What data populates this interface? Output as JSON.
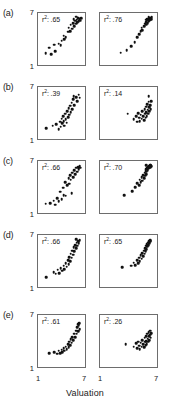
{
  "figure": {
    "xlabel": "Valuation",
    "x_ticks": [
      "1",
      "7"
    ],
    "y_ticks": [
      "7",
      "1"
    ],
    "rows": [
      {
        "label": "(a)",
        "panels": [
          {
            "r2_prefix": "r",
            "r2_sup": "2",
            "r2_value": ": .65"
          },
          {
            "r2_prefix": "r",
            "r2_sup": "2",
            "r2_value": ": .76"
          }
        ]
      },
      {
        "label": "(b)",
        "panels": [
          {
            "r2_prefix": "r",
            "r2_sup": "2",
            "r2_value": ": .39"
          },
          {
            "r2_prefix": "r",
            "r2_sup": "2",
            "r2_value": ": .14"
          }
        ]
      },
      {
        "label": "(c)",
        "panels": [
          {
            "r2_prefix": "r",
            "r2_sup": "2",
            "r2_value": ": .66"
          },
          {
            "r2_prefix": "r",
            "r2_sup": "2",
            "r2_value": ": .70"
          }
        ]
      },
      {
        "label": "(d)",
        "panels": [
          {
            "r2_prefix": "r",
            "r2_sup": "2",
            "r2_value": ": .66"
          },
          {
            "r2_prefix": "r",
            "r2_sup": "2",
            "r2_value": ": .65"
          }
        ]
      },
      {
        "label": "(e)",
        "panels": [
          {
            "r2_prefix": "r",
            "r2_sup": "2",
            "r2_value": ": .61"
          },
          {
            "r2_prefix": "r",
            "r2_sup": "2",
            "r2_value": ": .26"
          }
        ]
      }
    ]
  },
  "chart_data": {
    "type": "scatter",
    "title": "",
    "xlabel": "Valuation",
    "ylabel": "",
    "xlim": [
      1,
      7
    ],
    "ylim": [
      1,
      7
    ],
    "xticks": [
      1,
      7
    ],
    "yticks": [
      1,
      7
    ],
    "grid": false,
    "legend": "none",
    "panel_layout": {
      "rows": 5,
      "cols": 2
    },
    "panels": [
      {
        "row": "(a)",
        "col": 1,
        "annotation": "r2: .65",
        "r_squared": 0.65,
        "points": [
          [
            1.8,
            2.2
          ],
          [
            2.6,
            2.1
          ],
          [
            3.1,
            2.5
          ],
          [
            2.3,
            2.9
          ],
          [
            3.0,
            3.3
          ],
          [
            3.6,
            3.4
          ],
          [
            4.0,
            3.8
          ],
          [
            4.3,
            4.4
          ],
          [
            4.6,
            4.2
          ],
          [
            4.9,
            4.9
          ],
          [
            5.0,
            5.4
          ],
          [
            5.2,
            5.0
          ],
          [
            5.3,
            5.8
          ],
          [
            5.5,
            5.3
          ],
          [
            5.6,
            6.0
          ],
          [
            5.8,
            5.6
          ],
          [
            5.9,
            6.3
          ],
          [
            6.0,
            5.9
          ],
          [
            6.1,
            6.4
          ],
          [
            6.2,
            6.1
          ],
          [
            6.3,
            6.6
          ],
          [
            6.4,
            6.2
          ],
          [
            6.5,
            6.5
          ],
          [
            6.6,
            6.3
          ],
          [
            6.7,
            6.6
          ],
          [
            6.0,
            6.8
          ],
          [
            5.7,
            6.5
          ],
          [
            4.4,
            4.0
          ],
          [
            3.9,
            3.2
          ]
        ]
      },
      {
        "row": "(a)",
        "col": 2,
        "annotation": "r2: .76",
        "r_squared": 0.76,
        "points": [
          [
            3.1,
            2.3
          ],
          [
            3.8,
            2.6
          ],
          [
            4.3,
            3.1
          ],
          [
            4.7,
            3.6
          ],
          [
            5.0,
            4.2
          ],
          [
            5.2,
            4.6
          ],
          [
            5.4,
            5.0
          ],
          [
            5.5,
            5.4
          ],
          [
            5.6,
            5.1
          ],
          [
            5.8,
            5.6
          ],
          [
            5.9,
            5.9
          ],
          [
            6.0,
            6.1
          ],
          [
            6.05,
            5.8
          ],
          [
            6.1,
            6.3
          ],
          [
            6.2,
            6.0
          ],
          [
            6.25,
            6.4
          ],
          [
            6.3,
            6.2
          ],
          [
            6.35,
            6.5
          ],
          [
            6.4,
            6.3
          ],
          [
            6.45,
            6.6
          ],
          [
            6.5,
            6.4
          ],
          [
            6.55,
            6.6
          ],
          [
            6.6,
            6.5
          ],
          [
            6.65,
            6.7
          ],
          [
            6.3,
            6.7
          ],
          [
            6.15,
            6.5
          ],
          [
            5.95,
            6.4
          ]
        ]
      },
      {
        "row": "(b)",
        "col": 1,
        "annotation": "r2: .39",
        "r_squared": 0.39,
        "points": [
          [
            1.9,
            2.1
          ],
          [
            2.8,
            2.4
          ],
          [
            3.3,
            2.6
          ],
          [
            3.6,
            2.0
          ],
          [
            3.8,
            2.9
          ],
          [
            3.9,
            2.3
          ],
          [
            4.0,
            3.3
          ],
          [
            4.1,
            2.7
          ],
          [
            4.2,
            3.6
          ],
          [
            4.3,
            3.0
          ],
          [
            4.4,
            2.4
          ],
          [
            4.5,
            3.9
          ],
          [
            4.6,
            3.2
          ],
          [
            4.7,
            2.8
          ],
          [
            4.8,
            4.2
          ],
          [
            4.9,
            3.5
          ],
          [
            5.0,
            4.6
          ],
          [
            5.1,
            3.8
          ],
          [
            5.2,
            4.9
          ],
          [
            5.3,
            4.1
          ],
          [
            5.4,
            5.3
          ],
          [
            5.5,
            4.5
          ],
          [
            5.6,
            5.7
          ],
          [
            5.8,
            5.0
          ],
          [
            6.0,
            6.0
          ],
          [
            6.2,
            5.5
          ],
          [
            6.4,
            6.3
          ],
          [
            6.5,
            5.9
          ],
          [
            5.7,
            6.1
          ]
        ]
      },
      {
        "row": "(b)",
        "col": 2,
        "annotation": "r2: .14",
        "r_squared": 0.14,
        "points": [
          [
            3.9,
            3.9
          ],
          [
            4.6,
            3.2
          ],
          [
            4.9,
            3.6
          ],
          [
            5.0,
            2.9
          ],
          [
            5.1,
            4.0
          ],
          [
            5.2,
            3.4
          ],
          [
            5.3,
            3.0
          ],
          [
            5.4,
            3.8
          ],
          [
            5.5,
            3.3
          ],
          [
            5.6,
            4.2
          ],
          [
            5.7,
            3.6
          ],
          [
            5.8,
            3.1
          ],
          [
            5.85,
            4.5
          ],
          [
            5.9,
            3.9
          ],
          [
            5.95,
            3.4
          ],
          [
            6.0,
            4.8
          ],
          [
            6.05,
            4.1
          ],
          [
            6.1,
            3.6
          ],
          [
            6.15,
            5.1
          ],
          [
            6.2,
            4.4
          ],
          [
            6.25,
            3.9
          ],
          [
            6.3,
            5.4
          ],
          [
            6.35,
            4.7
          ],
          [
            6.4,
            4.2
          ],
          [
            6.5,
            5.0
          ],
          [
            6.55,
            4.5
          ],
          [
            6.6,
            5.5
          ],
          [
            6.3,
            6.1
          ]
        ]
      },
      {
        "row": "(c)",
        "col": 1,
        "annotation": "r2: .66",
        "r_squared": 0.66,
        "points": [
          [
            1.8,
            1.9
          ],
          [
            2.4,
            2.0
          ],
          [
            2.9,
            2.3
          ],
          [
            3.1,
            1.8
          ],
          [
            3.4,
            2.6
          ],
          [
            3.6,
            2.2
          ],
          [
            3.8,
            3.4
          ],
          [
            4.0,
            2.5
          ],
          [
            4.2,
            3.9
          ],
          [
            4.3,
            3.0
          ],
          [
            4.5,
            4.6
          ],
          [
            4.6,
            2.9
          ],
          [
            4.8,
            4.2
          ],
          [
            5.0,
            5.1
          ],
          [
            5.1,
            4.4
          ],
          [
            5.2,
            5.5
          ],
          [
            5.3,
            4.9
          ],
          [
            5.4,
            3.2
          ],
          [
            5.5,
            5.8
          ],
          [
            5.6,
            5.2
          ],
          [
            5.8,
            6.1
          ],
          [
            5.9,
            5.6
          ],
          [
            6.0,
            6.4
          ],
          [
            6.2,
            5.9
          ],
          [
            6.3,
            6.5
          ],
          [
            6.4,
            6.2
          ],
          [
            6.5,
            6.6
          ],
          [
            6.6,
            6.4
          ]
        ]
      },
      {
        "row": "(c)",
        "col": 2,
        "annotation": "r2: .70",
        "r_squared": 0.7,
        "points": [
          [
            3.5,
            3.0
          ],
          [
            4.4,
            3.5
          ],
          [
            4.8,
            4.0
          ],
          [
            5.0,
            4.5
          ],
          [
            5.2,
            4.2
          ],
          [
            5.3,
            4.9
          ],
          [
            5.4,
            4.6
          ],
          [
            5.5,
            5.2
          ],
          [
            5.6,
            4.8
          ],
          [
            5.7,
            5.5
          ],
          [
            5.8,
            5.1
          ],
          [
            5.85,
            5.8
          ],
          [
            5.9,
            5.4
          ],
          [
            5.95,
            6.0
          ],
          [
            6.0,
            5.6
          ],
          [
            6.05,
            6.2
          ],
          [
            6.1,
            5.9
          ],
          [
            6.15,
            6.4
          ],
          [
            6.2,
            6.1
          ],
          [
            6.25,
            6.5
          ],
          [
            6.3,
            6.3
          ],
          [
            6.35,
            6.6
          ],
          [
            6.4,
            6.4
          ],
          [
            6.45,
            6.7
          ],
          [
            6.5,
            6.5
          ],
          [
            6.55,
            6.7
          ],
          [
            6.6,
            6.6
          ],
          [
            6.0,
            6.7
          ]
        ]
      },
      {
        "row": "(d)",
        "col": 1,
        "annotation": "r2: .66",
        "r_squared": 0.66,
        "points": [
          [
            1.9,
            2.0
          ],
          [
            2.9,
            2.6
          ],
          [
            3.2,
            2.4
          ],
          [
            3.5,
            2.9
          ],
          [
            3.7,
            2.5
          ],
          [
            3.9,
            3.1
          ],
          [
            4.1,
            2.8
          ],
          [
            4.3,
            3.4
          ],
          [
            4.4,
            3.0
          ],
          [
            4.6,
            3.7
          ],
          [
            4.7,
            3.3
          ],
          [
            4.9,
            4.1
          ],
          [
            5.0,
            3.6
          ],
          [
            5.1,
            4.5
          ],
          [
            5.2,
            4.0
          ],
          [
            5.3,
            4.9
          ],
          [
            5.4,
            4.4
          ],
          [
            5.5,
            5.3
          ],
          [
            5.6,
            4.8
          ],
          [
            5.7,
            5.7
          ],
          [
            5.8,
            5.2
          ],
          [
            5.9,
            6.0
          ],
          [
            6.0,
            5.6
          ],
          [
            6.1,
            6.3
          ],
          [
            6.2,
            5.9
          ],
          [
            6.3,
            6.5
          ],
          [
            6.4,
            6.2
          ],
          [
            6.5,
            6.6
          ],
          [
            6.0,
            6.7
          ]
        ]
      },
      {
        "row": "(d)",
        "col": 2,
        "annotation": "r2: .65",
        "r_squared": 0.65,
        "points": [
          [
            3.3,
            3.2
          ],
          [
            4.3,
            3.4
          ],
          [
            4.6,
            3.8
          ],
          [
            4.8,
            3.5
          ],
          [
            5.0,
            4.1
          ],
          [
            5.1,
            3.7
          ],
          [
            5.2,
            4.4
          ],
          [
            5.3,
            4.0
          ],
          [
            5.4,
            4.7
          ],
          [
            5.5,
            4.3
          ],
          [
            5.6,
            5.0
          ],
          [
            5.7,
            4.6
          ],
          [
            5.8,
            5.3
          ],
          [
            5.85,
            4.9
          ],
          [
            5.9,
            5.6
          ],
          [
            5.95,
            5.2
          ],
          [
            6.0,
            5.9
          ],
          [
            6.05,
            5.5
          ],
          [
            6.1,
            6.1
          ],
          [
            6.15,
            5.8
          ],
          [
            6.2,
            6.3
          ],
          [
            6.25,
            6.0
          ],
          [
            6.3,
            6.5
          ],
          [
            6.35,
            6.2
          ],
          [
            6.4,
            6.4
          ],
          [
            6.45,
            6.6
          ],
          [
            6.5,
            6.5
          ]
        ]
      },
      {
        "row": "(e)",
        "col": 1,
        "annotation": "r2: .61",
        "r_squared": 0.61,
        "points": [
          [
            2.3,
            2.5
          ],
          [
            3.0,
            2.6
          ],
          [
            3.4,
            2.4
          ],
          [
            3.6,
            2.8
          ],
          [
            3.8,
            2.5
          ],
          [
            4.0,
            2.9
          ],
          [
            4.1,
            2.6
          ],
          [
            4.3,
            3.1
          ],
          [
            4.4,
            2.8
          ],
          [
            4.6,
            3.3
          ],
          [
            4.7,
            3.0
          ],
          [
            4.9,
            3.6
          ],
          [
            5.0,
            3.2
          ],
          [
            5.1,
            3.9
          ],
          [
            5.2,
            3.5
          ],
          [
            5.3,
            4.2
          ],
          [
            5.4,
            3.8
          ],
          [
            5.5,
            4.5
          ],
          [
            5.6,
            4.1
          ],
          [
            5.8,
            4.9
          ],
          [
            5.9,
            4.5
          ],
          [
            6.0,
            5.3
          ],
          [
            6.1,
            4.9
          ],
          [
            6.2,
            5.7
          ],
          [
            6.3,
            5.2
          ],
          [
            6.4,
            5.9
          ],
          [
            6.5,
            5.5
          ],
          [
            6.3,
            6.1
          ],
          [
            6.45,
            6.2
          ]
        ]
      },
      {
        "row": "(e)",
        "col": 2,
        "annotation": "r2: .26",
        "r_squared": 0.26,
        "points": [
          [
            3.7,
            3.6
          ],
          [
            4.6,
            3.3
          ],
          [
            4.9,
            3.7
          ],
          [
            5.0,
            3.1
          ],
          [
            5.1,
            3.9
          ],
          [
            5.2,
            3.4
          ],
          [
            5.3,
            3.0
          ],
          [
            5.4,
            3.8
          ],
          [
            5.5,
            3.3
          ],
          [
            5.6,
            4.1
          ],
          [
            5.7,
            3.6
          ],
          [
            5.8,
            3.2
          ],
          [
            5.85,
            4.4
          ],
          [
            5.9,
            3.9
          ],
          [
            5.95,
            3.5
          ],
          [
            6.0,
            4.6
          ],
          [
            6.05,
            4.0
          ],
          [
            6.1,
            3.6
          ],
          [
            6.15,
            4.9
          ],
          [
            6.2,
            4.3
          ],
          [
            6.25,
            3.9
          ],
          [
            6.3,
            5.1
          ],
          [
            6.35,
            4.6
          ],
          [
            6.4,
            4.1
          ],
          [
            6.5,
            4.8
          ],
          [
            6.55,
            4.4
          ],
          [
            6.6,
            5.0
          ],
          [
            6.45,
            5.3
          ]
        ]
      }
    ]
  }
}
